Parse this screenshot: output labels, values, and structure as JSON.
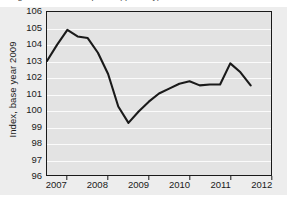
{
  "figure": {
    "cut_off_title": "Figure: Index development (quarterly)",
    "background_color": "#ededed",
    "plot_background_color": "#e3e3e3",
    "gridline_color": "#fbfbfb",
    "axis_color": "#1a1a1a",
    "line_color": "#1a1a1a"
  },
  "chart_data": {
    "type": "line",
    "title": "",
    "xlabel": "",
    "ylabel": "Index, base year 2009",
    "ylim": [
      96,
      106
    ],
    "xlim": [
      2006.5,
      2012.0
    ],
    "grid": true,
    "legend": false,
    "yticks": [
      96,
      97,
      98,
      99,
      100,
      101,
      102,
      103,
      104,
      105,
      106
    ],
    "ytick_labels": [
      "96",
      "97",
      "98",
      "99",
      "100",
      "101",
      "102",
      "103",
      "104",
      "105",
      "106"
    ],
    "xticks": [
      2007,
      2008,
      2009,
      2010,
      2011,
      2012
    ],
    "xtick_labels": [
      "2007",
      "2008",
      "2009",
      "2010",
      "2011",
      "2012"
    ],
    "x_label_positions": [
      2006.75,
      2007.75,
      2008.75,
      2009.75,
      2010.75,
      2011.75
    ],
    "series": [
      {
        "name": "Index",
        "x": [
          2006.5,
          2006.75,
          2007.0,
          2007.25,
          2007.5,
          2007.75,
          2008.0,
          2008.25,
          2008.5,
          2008.75,
          2009.0,
          2009.25,
          2009.5,
          2009.75,
          2010.0,
          2010.25,
          2010.5,
          2010.75,
          2011.0,
          2011.25,
          2011.5
        ],
        "values": [
          103.0,
          104.0,
          104.9,
          104.5,
          104.4,
          103.5,
          102.2,
          100.2,
          99.2,
          99.9,
          100.5,
          101.0,
          101.3,
          101.6,
          101.75,
          101.5,
          101.55,
          101.55,
          102.85,
          102.3,
          101.5
        ]
      }
    ]
  }
}
